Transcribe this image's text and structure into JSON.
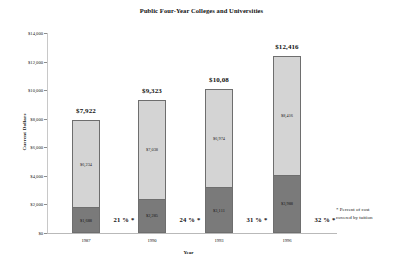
{
  "chart_data": {
    "type": "bar",
    "subtype": "stacked",
    "title": "Public Four-Year Colleges and Universities",
    "xlabel": "Year",
    "ylabel": "Current Dollars",
    "categories": [
      "1987",
      "1990",
      "1993",
      "1996"
    ],
    "ylim": [
      0,
      14000
    ],
    "ytick_values": [
      0,
      2000,
      4000,
      6000,
      8000,
      10000,
      12000,
      14000
    ],
    "ytick_labels": [
      "$0",
      "$2,000",
      "$4,000",
      "$6,000",
      "$8,000",
      "$10,000",
      "$12,000",
      "$14,000"
    ],
    "grid": false,
    "legend": "none",
    "series": [
      {
        "name": "Tuition",
        "position": "bottom",
        "color": "#7a7a7a",
        "values": [
          1688,
          2285,
          3111,
          3988
        ],
        "value_labels": [
          "$1,688",
          "$2,285",
          "$3,111",
          "$3,988"
        ]
      },
      {
        "name": "Other cost",
        "position": "top",
        "color": "#d4d4d4",
        "values": [
          6234,
          7038,
          6974,
          8416
        ],
        "value_labels": [
          "$6,234",
          "$7,038",
          "$6,974",
          "$8,416"
        ]
      }
    ],
    "totals": [
      7922,
      9323,
      10085,
      12416
    ],
    "total_labels": [
      "$7,922",
      "$9,323",
      "$10,08",
      "$12,416"
    ],
    "annotations": [
      "21 % *",
      "24 % *",
      "31 % *",
      "32 % *"
    ],
    "footnote_line1": "* Percent of cost",
    "footnote_line2": "covered by tuition"
  }
}
